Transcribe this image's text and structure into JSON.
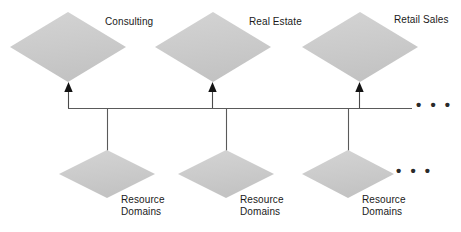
{
  "diagram": {
    "type": "hierarchy-bus-diagram",
    "background_color": "#ffffff",
    "node_fill_color": "#cccccc",
    "line_color": "#555555",
    "arrow_color": "#111111",
    "text_color": "#1a1a1a",
    "top_nodes": [
      {
        "id": "consulting",
        "label": "Consulting",
        "shape": "diamond",
        "cx": 68,
        "cy": 47,
        "rx": 58,
        "ry": 35,
        "label_x": 105,
        "label_y": 16
      },
      {
        "id": "real-estate",
        "label": "Real Estate",
        "shape": "diamond",
        "cx": 213,
        "cy": 47,
        "rx": 58,
        "ry": 35,
        "label_x": 249,
        "label_y": 16
      },
      {
        "id": "retail-sales",
        "label": "Retail Sales",
        "shape": "diamond",
        "cx": 360,
        "cy": 47,
        "rx": 58,
        "ry": 35,
        "label_x": 394,
        "label_y": 14
      }
    ],
    "bottom_nodes": [
      {
        "id": "resource-domains-1",
        "label_line1": "Resource",
        "label_line2": "Domains",
        "shape": "diamond",
        "cx": 107,
        "cy": 174,
        "rx": 48,
        "ry": 25,
        "label_x": 121,
        "label_y": 194
      },
      {
        "id": "resource-domains-2",
        "label_line1": "Resource",
        "label_line2": "Domains",
        "shape": "diamond",
        "cx": 226,
        "cy": 174,
        "rx": 48,
        "ry": 25,
        "label_x": 240,
        "label_y": 194
      },
      {
        "id": "resource-domains-3",
        "label_line1": "Resource",
        "label_line2": "Domains",
        "shape": "diamond",
        "cx": 348,
        "cy": 174,
        "rx": 46,
        "ry": 25,
        "label_x": 362,
        "label_y": 194
      }
    ],
    "bus_line": {
      "x_start": 68,
      "x_end": 412,
      "y": 108
    },
    "up_arrows": [
      {
        "x": 68,
        "y_tip": 83,
        "y_base": 108
      },
      {
        "x": 212,
        "y_tip": 83,
        "y_base": 108
      },
      {
        "x": 359,
        "y_tip": 83,
        "y_base": 108
      }
    ],
    "down_connectors": [
      {
        "x": 107,
        "y_start": 108,
        "y_end": 152
      },
      {
        "x": 226,
        "y_start": 108,
        "y_end": 152
      },
      {
        "x": 348,
        "y_start": 108,
        "y_end": 152
      }
    ],
    "ellipses": [
      {
        "id": "bus-ellipsis",
        "text": "• • •",
        "x": 416,
        "y": 97
      },
      {
        "id": "bottom-ellipsis",
        "text": "• • •",
        "x": 396,
        "y": 163
      }
    ]
  }
}
